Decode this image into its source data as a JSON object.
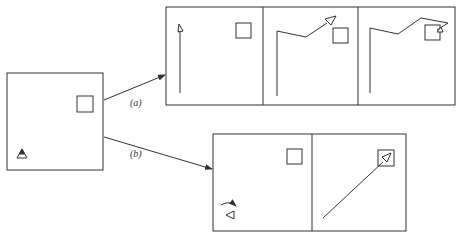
{
  "diagram": {
    "type": "robot navigation sequence",
    "colors": {
      "stroke": "#333333",
      "background": "#ffffff"
    },
    "source_panel": {
      "objects": [
        {
          "kind": "agent-triangle",
          "facing": "up"
        },
        {
          "kind": "target-box"
        }
      ]
    },
    "branches": [
      {
        "label": "(a)",
        "panels": [
          {
            "description": "agent travels straight up along left edge",
            "objects": [
              "path",
              "agent-triangle",
              "target-box"
            ]
          },
          {
            "description": "agent turns right, then heads toward target diagonally",
            "objects": [
              "path",
              "agent-triangle",
              "target-box"
            ]
          },
          {
            "description": "agent overshoots past target and doubles back into box",
            "objects": [
              "path",
              "agent-triangle",
              "target-box"
            ]
          }
        ]
      },
      {
        "label": "(b)",
        "panels": [
          {
            "description": "agent rotates in place to face target",
            "objects": [
              "rotation-arrow",
              "agent-triangle",
              "target-box"
            ]
          },
          {
            "description": "agent travels directly in straight line to target",
            "objects": [
              "path",
              "agent-triangle",
              "target-box"
            ]
          }
        ]
      }
    ]
  }
}
